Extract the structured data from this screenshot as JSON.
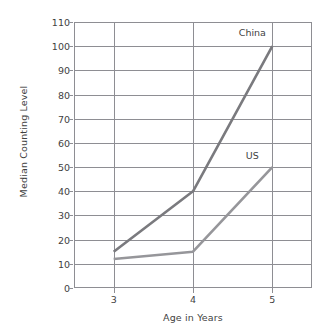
{
  "chart_data": {
    "type": "line",
    "title": "",
    "xlabel": "Age in Years",
    "ylabel": "Median Counting Level",
    "x": [
      3,
      4,
      5
    ],
    "categories": [
      "3",
      "4",
      "5"
    ],
    "xlim": [
      2.5,
      5.5
    ],
    "ylim": [
      0,
      110
    ],
    "xticks": [
      "3",
      "4",
      "5"
    ],
    "yticks": [
      "0",
      "10",
      "20",
      "30",
      "40",
      "50",
      "60",
      "70",
      "80",
      "90",
      "100",
      "110"
    ],
    "grid": "both",
    "legend_position": "inline-end-of-line",
    "series": [
      {
        "name": "China",
        "values": [
          15,
          40,
          100
        ],
        "color": "#7a7a7e",
        "width": 2.6,
        "label_x": 5,
        "label_y": 106
      },
      {
        "name": "US",
        "values": [
          12,
          15,
          50
        ],
        "color": "#96969a",
        "width": 2.6,
        "label_x": 5,
        "label_y": 55
      }
    ]
  },
  "axes": {
    "y_title": "Median Counting Level",
    "x_title": "Age in Years",
    "y_ticks": [
      "110",
      "100",
      "90",
      "80",
      "70",
      "60",
      "50",
      "40",
      "30",
      "20",
      "10",
      "0"
    ],
    "x_ticks": [
      "3",
      "4",
      "5"
    ],
    "frame_color": "#8e8e93",
    "grid_color": "#8e8e93",
    "text_color": "#3f3f3f"
  }
}
